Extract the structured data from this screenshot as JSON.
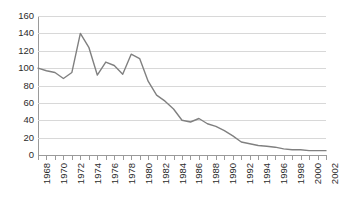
{
  "chart_data": {
    "type": "line",
    "title": "",
    "subtitle": "",
    "xlabel": "",
    "ylabel": "",
    "xlim": [
      1968,
      2002
    ],
    "ylim": [
      0,
      160
    ],
    "ytick_step": 20,
    "xtick_step": 1,
    "xlabel_step": 2,
    "grid": true,
    "legend": false,
    "legend_position": "none",
    "line_color": "#808080",
    "grid_color": "#d8d8d8",
    "axis_color": "#9a9a9a",
    "text_color": "#2b2b2b",
    "yticks": [
      0,
      20,
      40,
      60,
      80,
      100,
      120,
      140,
      160
    ],
    "xticks": [
      1968,
      1969,
      1970,
      1971,
      1972,
      1973,
      1974,
      1975,
      1976,
      1977,
      1978,
      1979,
      1980,
      1981,
      1982,
      1983,
      1984,
      1985,
      1986,
      1987,
      1988,
      1989,
      1990,
      1991,
      1992,
      1993,
      1994,
      1995,
      1996,
      1997,
      1998,
      1999,
      2000,
      2001,
      2002
    ],
    "xtick_labels": [
      "1968",
      "1970",
      "1972",
      "1974",
      "1976",
      "1978",
      "1980",
      "1982",
      "1984",
      "1986",
      "1988",
      "1990",
      "1992",
      "1994",
      "1996",
      "1998",
      "2000",
      "2002"
    ],
    "x": [
      1968,
      1969,
      1970,
      1971,
      1972,
      1973,
      1974,
      1975,
      1976,
      1977,
      1978,
      1979,
      1980,
      1981,
      1982,
      1983,
      1984,
      1985,
      1986,
      1987,
      1988,
      1989,
      1990,
      1991,
      1992,
      1993,
      1994,
      1995,
      1996,
      1997,
      1998,
      1999,
      2000,
      2001,
      2002
    ],
    "values": [
      100,
      97,
      95,
      88,
      95,
      140,
      124,
      92,
      107,
      103,
      93,
      116,
      111,
      85,
      69,
      62,
      53,
      40,
      38,
      42,
      36,
      33,
      28,
      22,
      15,
      13,
      11,
      10,
      9,
      7,
      6,
      6,
      5,
      5,
      5
    ],
    "series": [
      {
        "name": "series-1",
        "color": "#808080",
        "values": [
          100,
          97,
          95,
          88,
          95,
          140,
          124,
          92,
          107,
          103,
          93,
          116,
          111,
          85,
          69,
          62,
          53,
          40,
          38,
          42,
          36,
          33,
          28,
          22,
          15,
          13,
          11,
          10,
          9,
          7,
          6,
          6,
          5,
          5,
          5
        ]
      }
    ]
  }
}
